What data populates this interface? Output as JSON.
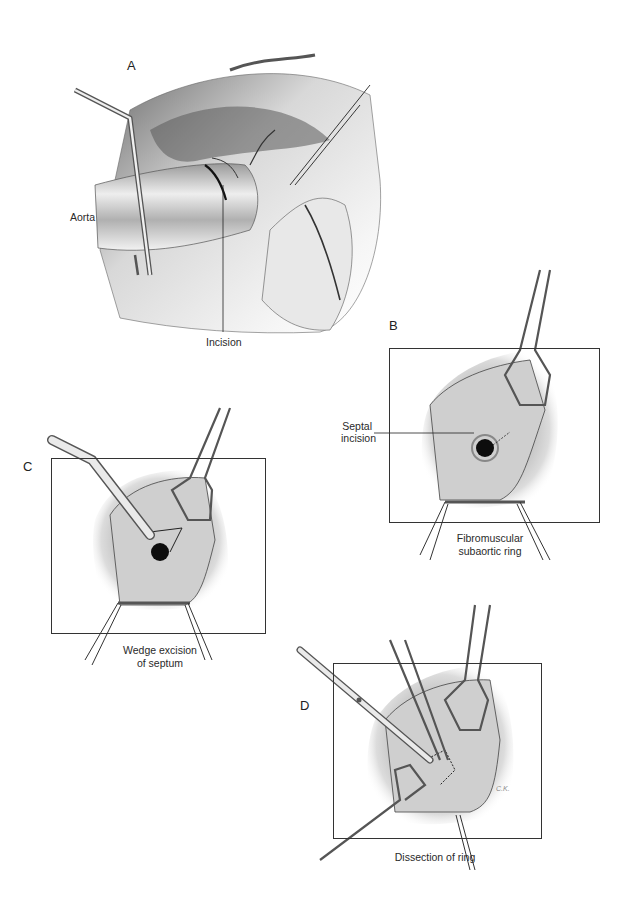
{
  "figure": {
    "panels": [
      {
        "id": "A",
        "letter": "A",
        "labels": {
          "aorta": "Aorta",
          "incision": "Incision"
        }
      },
      {
        "id": "B",
        "letter": "B",
        "labels": {
          "septal_incision_line1": "Septal",
          "septal_incision_line2": "incision"
        },
        "caption_line1": "Fibromuscular",
        "caption_line2": "subaortic ring"
      },
      {
        "id": "C",
        "letter": "C",
        "caption_line1": "Wedge excision",
        "caption_line2": "of septum"
      },
      {
        "id": "D",
        "letter": "D",
        "caption_line1": "Dissection of ring",
        "signature": "C.K."
      }
    ]
  },
  "colors": {
    "background": "#ffffff",
    "frame": "#333333",
    "tissue_light": "#e8e8e8",
    "tissue_mid": "#a8a8a8",
    "tissue_dark": "#4a4a4a",
    "instrument": "#d9d9d9"
  }
}
